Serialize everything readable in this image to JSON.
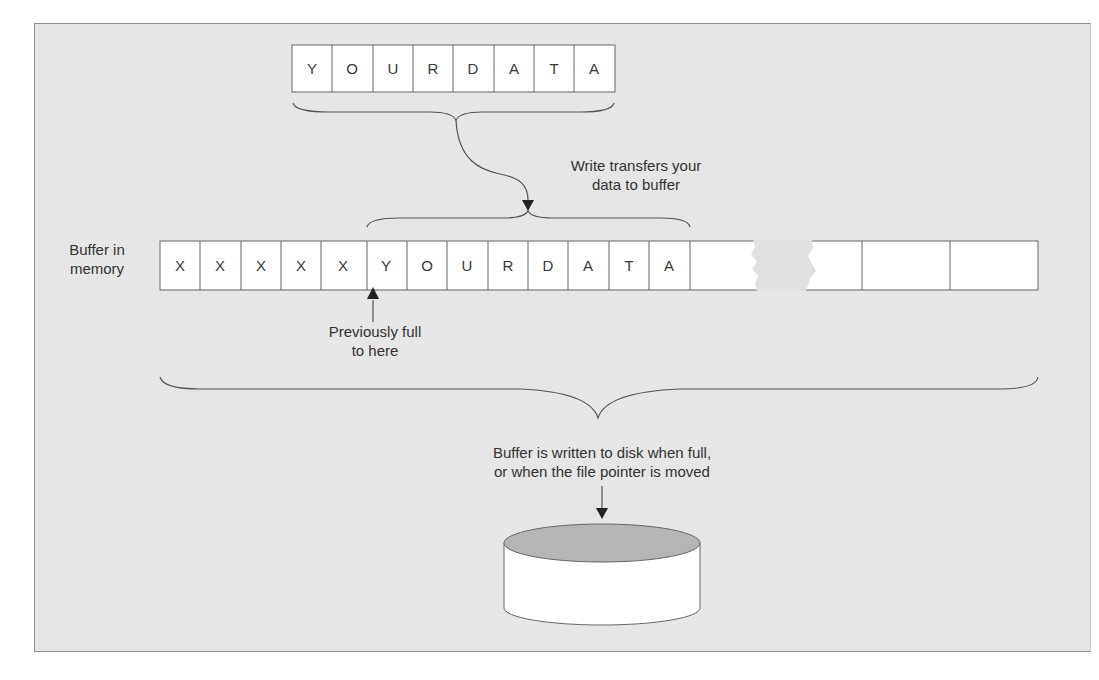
{
  "diagram": {
    "colors": {
      "background": "#e6e6e6",
      "cell_fill": "#ffffff",
      "line": "#555555",
      "disk_top": "#b0b0b0"
    },
    "input_data": {
      "cells": [
        "Y",
        "O",
        "U",
        "R",
        "D",
        "A",
        "T",
        "A"
      ]
    },
    "write_label": {
      "line1": "Write transfers your",
      "line2": "data to buffer"
    },
    "buffer": {
      "label_line1": "Buffer in",
      "label_line2": "memory",
      "cells": [
        "X",
        "X",
        "X",
        "X",
        "X",
        "Y",
        "O",
        "U",
        "R",
        "D",
        "A",
        "T",
        "A",
        "",
        "",
        "",
        ""
      ],
      "has_break": true
    },
    "previous_marker": {
      "line1": "Previously full",
      "line2": "to here"
    },
    "flush_label": {
      "line1": "Buffer is written to disk when full,",
      "line2": "or when the file pointer is moved"
    },
    "disk": {
      "icon": "disk-cylinder-icon"
    }
  }
}
